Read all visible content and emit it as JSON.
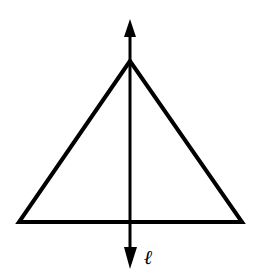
{
  "diagram": {
    "stroke_color": "#000000",
    "background_color": "#ffffff",
    "triangle": {
      "apex": [
        130,
        61
      ],
      "base_left": [
        19,
        222
      ],
      "base_right": [
        242,
        222
      ]
    },
    "line": {
      "x": 130,
      "y_top": 20,
      "y_bottom": 268,
      "label": "ℓ",
      "arrows": [
        "top",
        "bottom"
      ]
    }
  }
}
